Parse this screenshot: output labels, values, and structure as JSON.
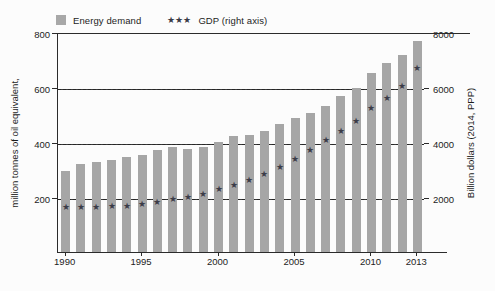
{
  "legend": {
    "items": [
      {
        "label": "Energy demand",
        "marker": "swatch",
        "color": "#a8a8a8"
      },
      {
        "label": "GDP (right axis)",
        "marker": "stars",
        "color": "#3c3c48"
      }
    ]
  },
  "axis_titles": {
    "left": "million tonnes of oil equivalent,",
    "right": "Billion dollars (2014, PPP)"
  },
  "chart_data": {
    "type": "bar",
    "title": "",
    "xlabel": "",
    "ylabel": "million tonnes of oil equivalent,",
    "y2label": "Billion dollars (2014, PPP)",
    "grid": true,
    "legend_position": "top-left",
    "categories": [
      "1990",
      "1991",
      "1992",
      "1993",
      "1994",
      "1995",
      "1996",
      "1997",
      "1998",
      "1999",
      "2000",
      "2001",
      "2002",
      "2003",
      "2004",
      "2005",
      "2006",
      "2007",
      "2008",
      "2009",
      "2010",
      "2011",
      "2012",
      "2013"
    ],
    "x_tick_labels": [
      "1990",
      "1995",
      "2000",
      "2005",
      "2010",
      "2013"
    ],
    "ylim": [
      0,
      800
    ],
    "y_ticks": [
      200,
      400,
      600,
      800
    ],
    "y2lim": [
      0,
      8000
    ],
    "y2_ticks": [
      2000,
      4000,
      6000,
      8000
    ],
    "series": [
      {
        "name": "Energy demand",
        "type": "bar",
        "axis": "left",
        "units": "Mtoe",
        "color": "#a6a6a6",
        "values": [
          300,
          325,
          330,
          340,
          348,
          355,
          375,
          385,
          380,
          385,
          405,
          425,
          428,
          445,
          468,
          490,
          510,
          535,
          570,
          600,
          655,
          690,
          720,
          770
        ]
      },
      {
        "name": "GDP (right axis)",
        "type": "scatter",
        "axis": "right",
        "units": "Billion dollars (2014, PPP)",
        "color": "#3c3c48",
        "marker": "star",
        "values": [
          1700,
          1700,
          1700,
          1720,
          1740,
          1790,
          1880,
          1980,
          2060,
          2180,
          2330,
          2480,
          2680,
          2900,
          3150,
          3430,
          3760,
          4130,
          4450,
          4820,
          5280,
          5660,
          6100,
          6750
        ]
      }
    ]
  }
}
